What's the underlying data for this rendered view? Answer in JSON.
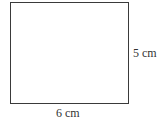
{
  "figure": {
    "shape": "rectangle",
    "height_label": "5 cm",
    "width_label": "6 cm",
    "stroke_color": "#3a3a3a"
  }
}
